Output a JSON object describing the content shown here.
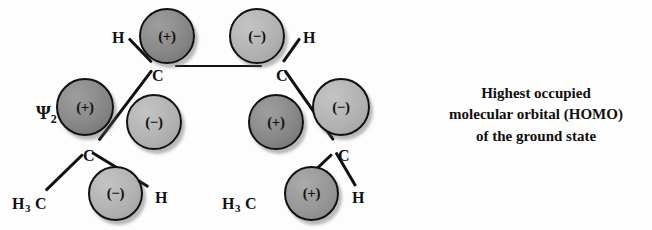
{
  "figure": {
    "wavefunction_label": {
      "symbol": "Ψ",
      "subscript": "2"
    },
    "caption_lines": [
      "Highest occupied",
      "molecular orbital (HOMO)",
      "of the ground state"
    ],
    "background_color": "#fdfdfd",
    "outline_color": "#111111",
    "lobe_fill_dark": "#8a8a8a",
    "lobe_fill_mid": "#9a9a9a",
    "lobe_fill_light": "#b5b5b5"
  },
  "chart_data": {
    "type": "diagram",
    "wavefunction": "Ψ₂",
    "lobes": [
      {
        "id": "lobe-c1-top",
        "sign": "(+)",
        "shade": "dark",
        "x": 139,
        "y": 8,
        "d": 56
      },
      {
        "id": "lobe-c2-top",
        "sign": "(−)",
        "shade": "light",
        "x": 229,
        "y": 8,
        "d": 56
      },
      {
        "id": "lobe-c1-left",
        "sign": "(+)",
        "shade": "dark",
        "x": 56,
        "y": 78,
        "d": 58
      },
      {
        "id": "lobe-c2-right",
        "sign": "(−)",
        "shade": "light",
        "x": 312,
        "y": 78,
        "d": 58
      },
      {
        "id": "lobe-c3-inner",
        "sign": "(−)",
        "shade": "light",
        "x": 126,
        "y": 94,
        "d": 56
      },
      {
        "id": "lobe-c4-inner",
        "sign": "(+)",
        "shade": "dark",
        "x": 248,
        "y": 94,
        "d": 56
      },
      {
        "id": "lobe-c3-bottom",
        "sign": "(−)",
        "shade": "light",
        "x": 88,
        "y": 166,
        "d": 55
      },
      {
        "id": "lobe-c4-bottom",
        "sign": "(+)",
        "shade": "mid",
        "x": 284,
        "y": 166,
        "d": 55
      }
    ],
    "atoms": [
      {
        "id": "atom-c1",
        "label": "C",
        "x": 152,
        "y": 68
      },
      {
        "id": "atom-c2",
        "label": "C",
        "x": 276,
        "y": 68
      },
      {
        "id": "atom-c3",
        "label": "C",
        "x": 83,
        "y": 148
      },
      {
        "id": "atom-c4",
        "label": "C",
        "x": 338,
        "y": 148
      },
      {
        "id": "atom-h1",
        "label": "H",
        "x": 112,
        "y": 30
      },
      {
        "id": "atom-h2",
        "label": "H",
        "x": 303,
        "y": 30
      },
      {
        "id": "atom-h3",
        "label": "H",
        "x": 155,
        "y": 190
      },
      {
        "id": "atom-h4",
        "label": "H",
        "x": 352,
        "y": 190
      },
      {
        "id": "atom-methyl-left",
        "label": "H3C",
        "x": 12,
        "y": 196
      },
      {
        "id": "atom-methyl-right",
        "label": "H3C",
        "x": 222,
        "y": 196
      }
    ],
    "bonds": [
      {
        "id": "bond-c1-c2",
        "x1": 175,
        "y1": 66,
        "x2": 262,
        "y2": 66
      },
      {
        "id": "bond-c1-h1",
        "x1": 129,
        "y1": 38,
        "x2": 152,
        "y2": 62
      },
      {
        "id": "bond-c2-h2",
        "x1": 300,
        "y1": 38,
        "x2": 283,
        "y2": 62
      },
      {
        "id": "bond-c1-c3",
        "x1": 152,
        "y1": 70,
        "x2": 99,
        "y2": 140
      },
      {
        "id": "bond-c2-c4",
        "x1": 285,
        "y1": 70,
        "x2": 334,
        "y2": 140
      },
      {
        "id": "bond-c3-methyl",
        "x1": 83,
        "y1": 154,
        "x2": 46,
        "y2": 190
      },
      {
        "id": "bond-c4-methyl",
        "x1": 332,
        "y1": 154,
        "x2": 294,
        "y2": 190
      },
      {
        "id": "bond-c3-h3",
        "x1": 92,
        "y1": 152,
        "x2": 148,
        "y2": 186
      },
      {
        "id": "bond-c4-h4",
        "x1": 336,
        "y1": 152,
        "x2": 356,
        "y2": 186
      }
    ]
  }
}
